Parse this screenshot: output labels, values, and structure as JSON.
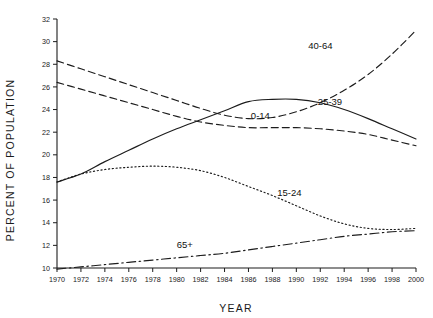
{
  "chart_data": {
    "type": "line",
    "title": "",
    "subtitle": "",
    "xlabel": "YEAR",
    "ylabel": "PERCENT OF POPULATION",
    "xlim": [
      1970,
      2000
    ],
    "ylim": [
      10,
      32
    ],
    "grid": false,
    "legend_position": "inline-labels",
    "x_ticks": [
      1970,
      1972,
      1974,
      1976,
      1978,
      1980,
      1982,
      1984,
      1986,
      1988,
      1990,
      1992,
      1994,
      1996,
      1998,
      2000
    ],
    "y_ticks": [
      10,
      12,
      14,
      16,
      18,
      20,
      22,
      24,
      26,
      28,
      30,
      32
    ],
    "x": [
      1970,
      1972,
      1974,
      1976,
      1978,
      1980,
      1982,
      1984,
      1986,
      1988,
      1990,
      1992,
      1994,
      1996,
      1998,
      2000
    ],
    "series": [
      {
        "name": "40-64",
        "label": "40-64",
        "line_style": "dashed",
        "label_x": 1991.0,
        "label_y": 29.6,
        "values": [
          28.3,
          27.6,
          26.9,
          26.2,
          25.5,
          24.8,
          24.1,
          23.5,
          23.2,
          23.3,
          23.8,
          24.6,
          25.7,
          27.1,
          28.9,
          31.0
        ]
      },
      {
        "name": "25-39",
        "label": "25-39",
        "line_style": "solid",
        "label_x": 1991.8,
        "label_y": 24.7,
        "values": [
          17.6,
          18.3,
          19.4,
          20.4,
          21.4,
          22.3,
          23.1,
          23.9,
          24.7,
          24.9,
          24.9,
          24.6,
          24.0,
          23.2,
          22.3,
          21.4
        ]
      },
      {
        "name": "0-14",
        "label": "0-14",
        "line_style": "dashed",
        "label_x": 1986.2,
        "label_y": 23.4,
        "values": [
          26.4,
          25.8,
          25.2,
          24.6,
          24.0,
          23.4,
          22.9,
          22.6,
          22.4,
          22.4,
          22.4,
          22.3,
          22.1,
          21.8,
          21.3,
          20.8
        ]
      },
      {
        "name": "15-24",
        "label": "15-24",
        "line_style": "dotted",
        "label_x": 1988.4,
        "label_y": 16.6,
        "values": [
          17.6,
          18.3,
          18.7,
          18.9,
          19.0,
          18.9,
          18.6,
          18.0,
          17.2,
          16.4,
          15.5,
          14.6,
          13.9,
          13.5,
          13.4,
          13.5
        ]
      },
      {
        "name": "65+",
        "label": "65+",
        "line_style": "dashdot",
        "label_x": 1980.0,
        "label_y": 12.0,
        "values": [
          9.9,
          10.1,
          10.3,
          10.5,
          10.7,
          10.9,
          11.1,
          11.3,
          11.6,
          11.9,
          12.2,
          12.5,
          12.8,
          13.0,
          13.2,
          13.3
        ]
      }
    ]
  },
  "colors": {
    "line": "#1c1c1c",
    "text": "#1a1a1a",
    "background": "#ffffff"
  }
}
